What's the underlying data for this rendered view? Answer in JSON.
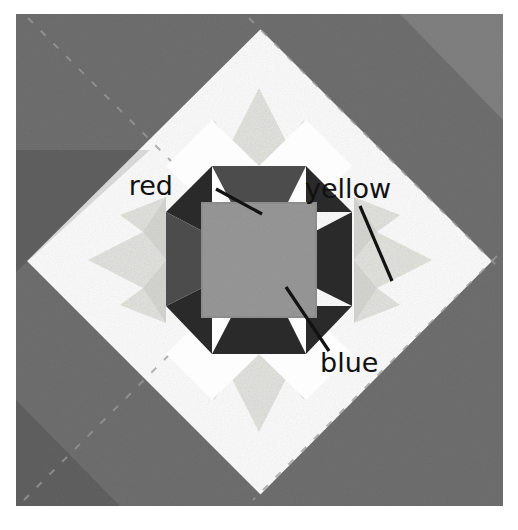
{
  "image": {
    "kind": "quilt-block-photograph",
    "description": "Grayscale photograph of a pieced quilt block set on point, with three printed text callouts identifying fabric colors.",
    "width": 518,
    "height": 530,
    "background_color": "#ffffff"
  },
  "palette": {
    "page_background": "#ffffff",
    "corner_triangle_gray": "#6f6f6f",
    "corner_triangle_gray_dark": "#636363",
    "background_white": "#fbfbfb",
    "star_point_pale": "#e3e3e0",
    "star_point_pale_shadow": "#d4d4d1",
    "dark_fabric": "#2b2b2b",
    "dark_fabric_soft": "#343434",
    "center_square_gray": "#989898",
    "stitch_line": "#8f8f8f",
    "annotation_text": "#111111",
    "leader_line": "#121212"
  },
  "annotations": [
    {
      "id": "red",
      "label": "red",
      "text_x": 173,
      "text_y": 195,
      "leader": {
        "x1": 216,
        "y1": 189,
        "x2": 262,
        "y2": 214
      },
      "points_to": "upper dark hourglass / bow-tie patch above the centre square"
    },
    {
      "id": "yellow",
      "label": "yellow",
      "text_x": 305,
      "text_y": 198,
      "leader": {
        "x1": 360,
        "y1": 206,
        "x2": 392,
        "y2": 281
      },
      "points_to": "pale star point on the right side of the block"
    },
    {
      "id": "blue",
      "label": "blue",
      "text_x": 320,
      "text_y": 372,
      "leader": {
        "x1": 286,
        "y1": 287,
        "x2": 329,
        "y2": 351
      },
      "points_to": "large light-grey square at the centre of the block"
    }
  ],
  "quilt_structure": {
    "setting": "on-point / diagonal set",
    "corner_triangles": [
      {
        "name": "top-left-corner-triangle",
        "color": "#6f6f6f"
      },
      {
        "name": "top-right-corner-triangle",
        "color": "#6f6f6f"
      },
      {
        "name": "bottom-left-corner-triangle",
        "color": "#6f6f6f"
      },
      {
        "name": "bottom-right-corner-triangle",
        "color": "#6f6f6f"
      }
    ],
    "centre_square": {
      "name": "centre-square",
      "color": "#989898",
      "label": "blue"
    },
    "hourglass_patches": {
      "name": "dark-hourglass-patches",
      "count": 4,
      "color": "#2b2b2b",
      "label": "red"
    },
    "star_points": {
      "name": "pale-star-points",
      "count": 4,
      "color": "#e3e3e0",
      "label": "yellow"
    },
    "white_diamonds": {
      "name": "white-corner-diamonds",
      "count": 4,
      "color": "#fbfbfb"
    }
  }
}
